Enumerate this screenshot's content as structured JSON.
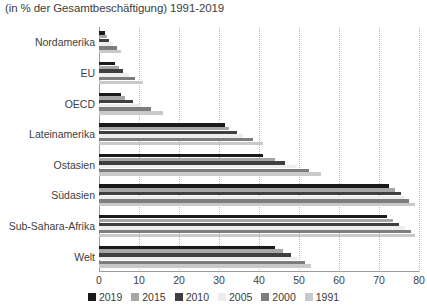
{
  "chart_data": {
    "type": "bar",
    "orientation": "horizontal",
    "title": "(in % der Gesamtbeschäftigung) 1991-2019",
    "xlabel": "",
    "ylabel": "",
    "xlim": [
      0,
      80
    ],
    "xticks": [
      0,
      10,
      20,
      30,
      40,
      50,
      60,
      70,
      80
    ],
    "grid": true,
    "legend_position": "bottom",
    "categories": [
      "Nordamerika",
      "EU",
      "OECD",
      "Lateinamerika",
      "Ostasien",
      "Südasien",
      "Sub-Sahara-Afrika",
      "Welt"
    ],
    "series": [
      {
        "name": "2019",
        "color": "#1a1a1a",
        "values": [
          1.5,
          4.0,
          5.5,
          31.5,
          41.0,
          72.5,
          72.0,
          44.0
        ]
      },
      {
        "name": "2015",
        "color": "#a6a6a6",
        "values": [
          2.0,
          5.0,
          6.5,
          32.5,
          44.0,
          74.0,
          73.5,
          46.0
        ]
      },
      {
        "name": "2010",
        "color": "#3f3f3f",
        "values": [
          2.5,
          6.0,
          8.5,
          34.5,
          46.5,
          75.5,
          75.0,
          48.0
        ]
      },
      {
        "name": "2005",
        "color": "#ededed",
        "values": [
          3.5,
          7.5,
          10.5,
          36.0,
          49.5,
          76.5,
          76.5,
          49.5
        ]
      },
      {
        "name": "2000",
        "color": "#7d7d7d",
        "values": [
          4.5,
          9.0,
          13.0,
          38.5,
          52.5,
          77.5,
          78.0,
          51.5
        ]
      },
      {
        "name": "1991",
        "color": "#c9c9c9",
        "values": [
          5.5,
          11.0,
          16.0,
          41.0,
          55.5,
          79.0,
          79.0,
          53.0
        ]
      }
    ]
  },
  "axis": {
    "x_tick_labels": [
      "0",
      "10",
      "20",
      "30",
      "40",
      "50",
      "60",
      "70",
      "80"
    ]
  }
}
